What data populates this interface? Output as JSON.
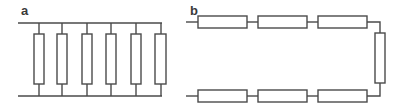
{
  "panels": [
    {
      "label": "a",
      "type": "parallel",
      "resistor_count": 6
    },
    {
      "label": "b",
      "type": "series",
      "resistor_count": 7
    }
  ],
  "colors": {
    "stroke": "#4a4a4a",
    "background": "#ffffff"
  }
}
